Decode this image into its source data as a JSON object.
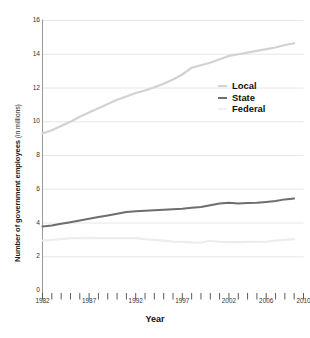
{
  "chart_data": {
    "type": "line",
    "title": "",
    "xlabel": "Year",
    "ylabel_bold": "Number of government employees",
    "ylabel_plain": " (in millions)",
    "ylabel_full": "Number of government employees (in millions)",
    "xlim": [
      1982,
      2010
    ],
    "ylim": [
      0,
      16
    ],
    "y_ticks": [
      0,
      2,
      4,
      6,
      8,
      10,
      12,
      14,
      16
    ],
    "y_tick_labels": [
      "0",
      "2",
      "4",
      "6",
      "8",
      "10",
      "12",
      "14",
      "16"
    ],
    "x_ticks": [
      1982,
      1983,
      1984,
      1985,
      1986,
      1987,
      1988,
      1989,
      1990,
      1991,
      1992,
      1993,
      1994,
      1995,
      1996,
      1997,
      1998,
      1999,
      2000,
      2001,
      2002,
      2003,
      2004,
      2005,
      2006,
      2007,
      2008,
      2009,
      2010
    ],
    "x_tick_labels_shown": [
      {
        "year": 1982,
        "label": "1982"
      },
      {
        "year": 1987,
        "label": "1987"
      },
      {
        "year": 1992,
        "label": "1992"
      },
      {
        "year": 1997,
        "label": "1997"
      },
      {
        "year": 2002,
        "label": "2002"
      },
      {
        "year": 2006,
        "label": "2006"
      },
      {
        "year": 2010,
        "label": "2010"
      }
    ],
    "grid": "horizontal",
    "legend_position": "upper-right",
    "x": [
      1982,
      1983,
      1984,
      1985,
      1986,
      1987,
      1988,
      1989,
      1990,
      1991,
      1992,
      1993,
      1994,
      1995,
      1996,
      1997,
      1998,
      1999,
      2000,
      2001,
      2002,
      2003,
      2004,
      2005,
      2006,
      2007,
      2008,
      2009
    ],
    "series": [
      {
        "name": "Local",
        "color": "#d2d2d2",
        "values": [
          9.3,
          9.5,
          9.75,
          10.0,
          10.3,
          10.55,
          10.8,
          11.05,
          11.3,
          11.5,
          11.7,
          11.85,
          12.05,
          12.25,
          12.5,
          12.8,
          13.2,
          13.35,
          13.5,
          13.7,
          13.9,
          14.0,
          14.1,
          14.2,
          14.3,
          14.4,
          14.55,
          14.65
        ]
      },
      {
        "name": "State",
        "color": "#6e6e6e",
        "values": [
          3.8,
          3.85,
          3.95,
          4.05,
          4.15,
          4.25,
          4.35,
          4.45,
          4.55,
          4.65,
          4.7,
          4.72,
          4.75,
          4.78,
          4.82,
          4.85,
          4.9,
          4.95,
          5.05,
          5.15,
          5.2,
          5.15,
          5.18,
          5.2,
          5.25,
          5.3,
          5.4,
          5.45
        ]
      },
      {
        "name": "Federal",
        "color": "#ededed",
        "values": [
          2.95,
          3.0,
          3.05,
          3.1,
          3.1,
          3.12,
          3.1,
          3.1,
          3.1,
          3.1,
          3.1,
          3.05,
          3.0,
          2.95,
          2.9,
          2.88,
          2.85,
          2.83,
          2.95,
          2.88,
          2.87,
          2.87,
          2.88,
          2.88,
          2.9,
          2.95,
          3.0,
          3.05
        ]
      }
    ]
  },
  "legend": {
    "items": [
      {
        "label": "Local",
        "color": "#d2d2d2"
      },
      {
        "label": "State",
        "color": "#6e6e6e"
      },
      {
        "label": "Federal",
        "color": "#f2f2f2"
      }
    ]
  }
}
